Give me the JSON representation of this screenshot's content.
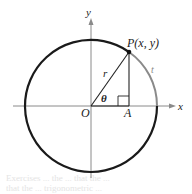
{
  "diagram": {
    "type": "unit-circle-trig",
    "labels": {
      "y_axis": "y",
      "x_axis": "x",
      "point": "P(x, y)",
      "radius": "r",
      "angle": "θ",
      "origin": "O",
      "foot": "A",
      "arc": "t"
    },
    "colors": {
      "circle": "#1a1a1a",
      "arc_highlight": "#8a8a8a",
      "axes": "#8a8a8a",
      "lines": "#222222"
    },
    "bleed_text": [
      "Exercises ... the ... that the ...",
      "that the ... trigonometric ..."
    ]
  }
}
